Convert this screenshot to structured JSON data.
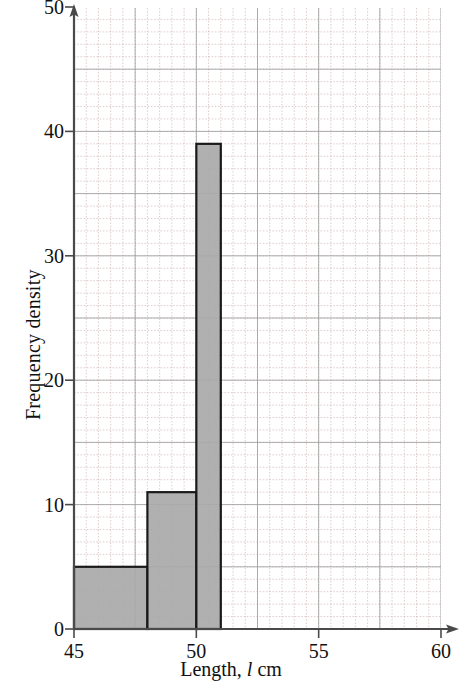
{
  "chart_data": {
    "type": "bar",
    "title": "",
    "subtitle": "",
    "xlabel": "Length, l cm",
    "xlabel_parts": {
      "before": "Length,",
      "variable": "l",
      "after": "cm"
    },
    "ylabel": "Frequency density",
    "xlim": [
      45,
      60
    ],
    "ylim": [
      0,
      50
    ],
    "x_ticks": [
      45,
      50,
      55,
      60
    ],
    "x_tick_labels": [
      "45",
      "50",
      "55",
      "60"
    ],
    "y_ticks": [
      0,
      10,
      20,
      30,
      40,
      50
    ],
    "y_tick_labels": [
      "0",
      "10",
      "20",
      "30",
      "40",
      "50"
    ],
    "grid": true,
    "grid_major_x_step": 2.5,
    "grid_major_y_step": 5,
    "grid_minor_x_step": 0.5,
    "grid_minor_y_step": 1,
    "legend": "none",
    "bar_fill_color": "#a9a9a9",
    "bar_edge_color": "#1a1a1a",
    "grid_major_color": "#9a9a9a",
    "grid_minor_color": "#c9a9a9",
    "axis_color": "#4a4a4a",
    "bars": [
      {
        "label": "45 ≤ l < 48",
        "x_start": 45,
        "x_end": 48,
        "height": 5,
        "frequency": 15
      },
      {
        "label": "48 ≤ l < 50",
        "x_start": 48,
        "x_end": 50,
        "height": 11,
        "frequency": 22
      },
      {
        "label": "50 ≤ l < 51",
        "x_start": 50,
        "x_end": 51,
        "height": 39,
        "frequency": 39
      }
    ],
    "categories": [
      "45-48",
      "48-50",
      "50-51"
    ],
    "values": [
      5,
      11,
      39
    ]
  },
  "axes": {
    "y_title": "Frequency density",
    "x_title_before": "Length,",
    "x_title_variable": "l",
    "x_title_after": "cm"
  }
}
